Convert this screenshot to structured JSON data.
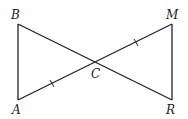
{
  "diagram": {
    "points": {
      "A": {
        "label": "A",
        "x": 18,
        "y": 100
      },
      "B": {
        "label": "B",
        "x": 18,
        "y": 24
      },
      "C": {
        "label": "C",
        "x": 95,
        "y": 62
      },
      "M": {
        "label": "M",
        "x": 172,
        "y": 24
      },
      "R": {
        "label": "R",
        "x": 172,
        "y": 100
      }
    },
    "segments": [
      "AB",
      "BR",
      "AM",
      "MR"
    ],
    "congruent_marks": [
      "AC",
      "CM"
    ]
  }
}
